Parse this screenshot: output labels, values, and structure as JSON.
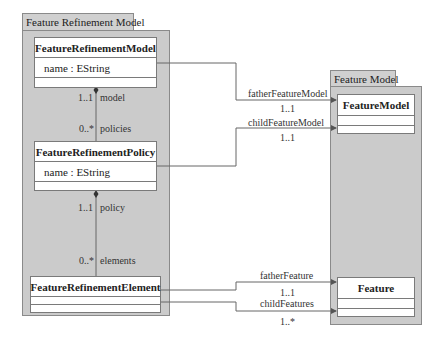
{
  "packages": [
    {
      "name": "Feature Refinement Model"
    },
    {
      "name": "Feature Model"
    }
  ],
  "classes": {
    "feature_refinement_model": {
      "name": "FeatureRefinementModel",
      "attributes": [
        "name : EString"
      ]
    },
    "feature_refinement_policy": {
      "name": "FeatureRefinementPolicy",
      "attributes": [
        "name : EString"
      ]
    },
    "feature_refinement_element": {
      "name": "FeatureRefinementElement",
      "attributes": []
    },
    "feature_model": {
      "name": "FeatureModel",
      "attributes": []
    },
    "feature": {
      "name": "Feature",
      "attributes": []
    }
  },
  "associations": {
    "model_policies": {
      "source_role": "model",
      "source_mult": "1..1",
      "target_role": "policies",
      "target_mult": "0..*"
    },
    "policy_elements": {
      "source_role": "policy",
      "source_mult": "1..1",
      "target_role": "elements",
      "target_mult": "0..*"
    },
    "father_feature_model": {
      "role": "fatherFeatureModel",
      "mult": "1..1"
    },
    "child_feature_model": {
      "role": "childFeatureModel",
      "mult": "1..1"
    },
    "father_feature": {
      "role": "fatherFeature",
      "mult": "1..1"
    },
    "child_features": {
      "role": "childFeatures",
      "mult": "1..*"
    }
  }
}
